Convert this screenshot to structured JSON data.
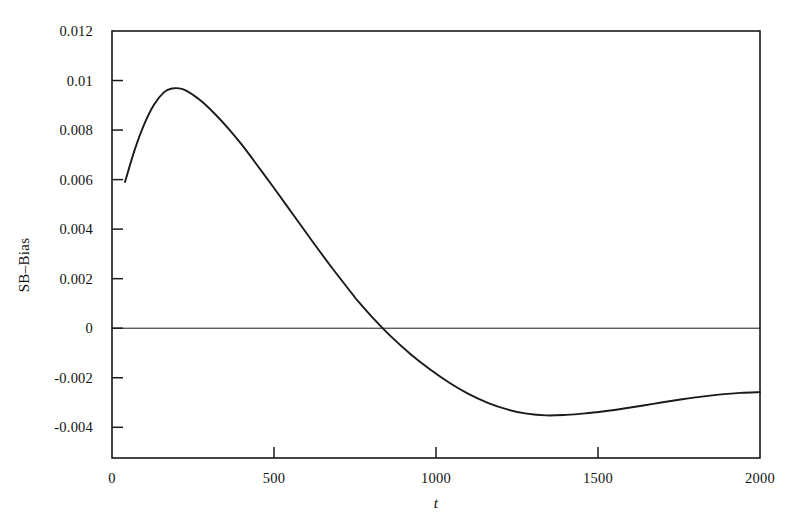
{
  "chart_data": {
    "type": "line",
    "title": "",
    "xlabel": "t",
    "ylabel": "SB–Bias",
    "xlim": [
      0,
      2000
    ],
    "ylim": [
      -0.00524,
      0.012
    ],
    "xticks": [
      0,
      500,
      1000,
      1500,
      2000
    ],
    "xticklabels": [
      "0",
      "500",
      "1000",
      "1500",
      "2000"
    ],
    "yticks": [
      0.012,
      0.01,
      0.008,
      0.006,
      0.004,
      0.002,
      0,
      -0.002,
      -0.004
    ],
    "yticklabels": [
      "0.012",
      "0.01",
      "0.008",
      "0.006",
      "0.004",
      "0.002",
      "0",
      "-0.002",
      "-0.004"
    ],
    "grid": false,
    "legend": null,
    "zero_line": 0,
    "series": [
      {
        "name": "SB-Bias",
        "color": "#1a1a1a",
        "x": [
          40,
          70,
          100,
          130,
          160,
          185,
          218,
          250,
          280,
          320,
          360,
          400,
          450,
          500,
          560,
          620,
          680,
          740,
          760,
          800,
          860,
          920,
          980,
          1040,
          1100,
          1160,
          1220,
          1280,
          1340,
          1400,
          1460,
          1520,
          1580,
          1640,
          1700,
          1760,
          1820,
          1880,
          1940,
          2000
        ],
        "y": [
          0.0059,
          0.0072,
          0.00825,
          0.00903,
          0.00952,
          0.00968,
          0.00965,
          0.00942,
          0.00912,
          0.00862,
          0.00805,
          0.00742,
          0.00655,
          0.00566,
          0.00457,
          0.00348,
          0.00242,
          0.00141,
          0.00108,
          0.00049,
          -0.00032,
          -0.00103,
          -0.00165,
          -0.00219,
          -0.00265,
          -0.00301,
          -0.00328,
          -0.00345,
          -0.00352,
          -0.0035,
          -0.00344,
          -0.00335,
          -0.00324,
          -0.00312,
          -0.00299,
          -0.00287,
          -0.00276,
          -0.00267,
          -0.00261,
          -0.00258
        ]
      }
    ]
  },
  "axes": {
    "frame": {
      "left": 112,
      "right": 760,
      "top": 31,
      "bottom": 458
    },
    "line_color": "#1a1a1a"
  }
}
